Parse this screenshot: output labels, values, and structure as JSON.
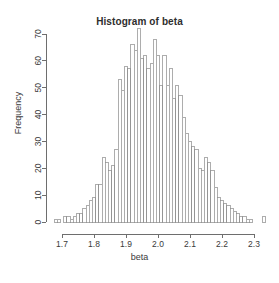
{
  "chart_data": {
    "type": "bar",
    "title": "Histogram of beta",
    "xlabel": "beta",
    "ylabel": "Frequency",
    "grid": false,
    "legend": null,
    "xlim": [
      1.675,
      2.335
    ],
    "ylim": [
      0,
      73
    ],
    "bin_width": 0.01,
    "x_ticks": [
      "1.7",
      "1.8",
      "1.9",
      "2.0",
      "2.1",
      "2.2",
      "2.3"
    ],
    "x_tick_values": [
      1.7,
      1.8,
      1.9,
      2.0,
      2.1,
      2.2,
      2.3
    ],
    "y_ticks": [
      "0",
      "10",
      "20",
      "30",
      "40",
      "50",
      "60",
      "70"
    ],
    "y_tick_values": [
      0,
      10,
      20,
      30,
      40,
      50,
      60,
      70
    ],
    "bin_starts": [
      1.675,
      1.685,
      1.695,
      1.705,
      1.715,
      1.725,
      1.735,
      1.745,
      1.755,
      1.765,
      1.775,
      1.785,
      1.795,
      1.805,
      1.815,
      1.825,
      1.835,
      1.845,
      1.855,
      1.865,
      1.875,
      1.885,
      1.895,
      1.905,
      1.915,
      1.925,
      1.935,
      1.945,
      1.955,
      1.965,
      1.975,
      1.985,
      1.995,
      2.005,
      2.015,
      2.025,
      2.035,
      2.045,
      2.055,
      2.065,
      2.075,
      2.085,
      2.095,
      2.105,
      2.115,
      2.125,
      2.135,
      2.145,
      2.155,
      2.165,
      2.175,
      2.185,
      2.195,
      2.205,
      2.215,
      2.225,
      2.235,
      2.245,
      2.255,
      2.265,
      2.275,
      2.285,
      2.295,
      2.305,
      2.315,
      2.325
    ],
    "categories": [
      "1.675",
      "1.685",
      "1.695",
      "1.705",
      "1.715",
      "1.725",
      "1.735",
      "1.745",
      "1.755",
      "1.765",
      "1.775",
      "1.785",
      "1.795",
      "1.805",
      "1.815",
      "1.825",
      "1.835",
      "1.845",
      "1.855",
      "1.865",
      "1.875",
      "1.885",
      "1.895",
      "1.905",
      "1.915",
      "1.925",
      "1.935",
      "1.945",
      "1.955",
      "1.965",
      "1.975",
      "1.985",
      "1.995",
      "2.005",
      "2.015",
      "2.025",
      "2.035",
      "2.045",
      "2.055",
      "2.065",
      "2.075",
      "2.085",
      "2.095",
      "2.105",
      "2.115",
      "2.125",
      "2.135",
      "2.145",
      "2.155",
      "2.165",
      "2.175",
      "2.185",
      "2.195",
      "2.205",
      "2.215",
      "2.225",
      "2.235",
      "2.245",
      "2.255",
      "2.265",
      "2.275",
      "2.285",
      "2.295",
      "2.305",
      "2.315",
      "2.325"
    ],
    "values": [
      1,
      1,
      0,
      2,
      2,
      1,
      2,
      3,
      3,
      5,
      6,
      8,
      9,
      14,
      14,
      24,
      22,
      19,
      21,
      27,
      53,
      49,
      58,
      57,
      66,
      64,
      72,
      61,
      62,
      57,
      59,
      68,
      62,
      51,
      62,
      51,
      57,
      46,
      51,
      47,
      39,
      33,
      30,
      28,
      27,
      20,
      19,
      24,
      22,
      19,
      13,
      9,
      8,
      7,
      6,
      5,
      4,
      3,
      2,
      2,
      1,
      1,
      0,
      0,
      0,
      2
    ]
  }
}
